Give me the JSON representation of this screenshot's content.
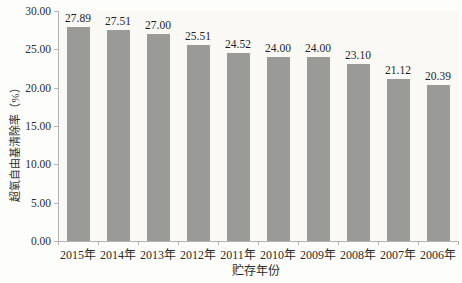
{
  "chart_data": {
    "type": "bar",
    "title": "",
    "categories": [
      "2015年",
      "2014年",
      "2013年",
      "2012年",
      "2011年",
      "2010年",
      "2009年",
      "2008年",
      "2007年",
      "2006年"
    ],
    "values": [
      27.89,
      27.51,
      27.0,
      25.51,
      24.52,
      24.0,
      24.0,
      23.1,
      21.12,
      20.39
    ],
    "value_labels": [
      "27.89",
      "27.51",
      "27.00",
      "25.51",
      "24.52",
      "24.00",
      "24.00",
      "23.10",
      "21.12",
      "20.39"
    ],
    "xlabel": "贮存年份",
    "ylabel": "超氧自由基清除率（%）",
    "ylim": [
      0,
      30
    ],
    "ytick_step": 5,
    "ytick_labels": [
      "0.00",
      "5.00",
      "10.00",
      "15.00",
      "20.00",
      "25.00",
      "30.00"
    ],
    "grid": false,
    "legend": "none",
    "bar_color": "#9a9a98",
    "axis_color": "#b3b3b3",
    "text_color": "#2b2b2b",
    "background": "#fdfdfb"
  }
}
